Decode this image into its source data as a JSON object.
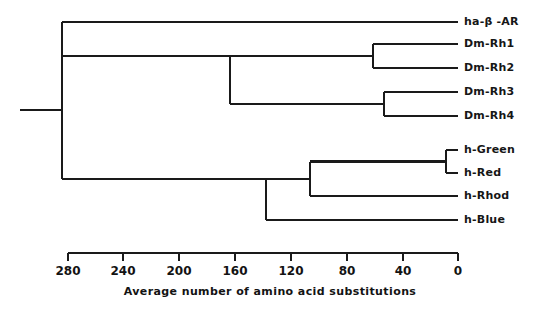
{
  "figure": {
    "type": "phylogenetic-tree-dendrogram",
    "background_color": "#ffffff",
    "line_color": "#1a1a1a",
    "text_color": "#131313"
  },
  "chart_data": {
    "type": "line",
    "subtype": "dendrogram",
    "title": "",
    "xlabel": "Average number of amino acid substitutions",
    "ylabel": "",
    "xlim": [
      280,
      0
    ],
    "x_axis_reversed": true,
    "grid": false,
    "legend": false,
    "tick_values": [
      280,
      240,
      200,
      160,
      120,
      80,
      40,
      0
    ],
    "tick_labels": [
      "280",
      "240",
      "200",
      "160",
      "120",
      "80",
      "40",
      "0"
    ],
    "tick_interval": 40,
    "leaves": [
      {
        "id": "ha-b-AR",
        "label": "ha-β -AR",
        "label_plain": "ha-beta-AR",
        "y": 22,
        "branch_from": 280
      },
      {
        "id": "Dm-Rh1",
        "label": "Dm-Rh1",
        "label_plain": "Dm-Rh1",
        "y": 44,
        "branch_from": 62
      },
      {
        "id": "Dm-Rh2",
        "label": "Dm-Rh2",
        "label_plain": "Dm-Rh2",
        "y": 68,
        "branch_from": 62
      },
      {
        "id": "Dm-Rh3",
        "label": "Dm-Rh3",
        "label_plain": "Dm-Rh3",
        "y": 92,
        "branch_from": 54
      },
      {
        "id": "Dm-Rh4",
        "label": "Dm-Rh4",
        "label_plain": "Dm-Rh4",
        "y": 116,
        "branch_from": 54
      },
      {
        "id": "h-Green",
        "label": "h-Green",
        "label_plain": "h-Green",
        "y": 150,
        "branch_from": 9
      },
      {
        "id": "h-Red",
        "label": "h-Red",
        "label_plain": "h-Red",
        "y": 173,
        "branch_from": 9
      },
      {
        "id": "h-Rhod",
        "label": "h-Rhod",
        "label_plain": "h-Rhod",
        "y": 196,
        "branch_from": 109
      },
      {
        "id": "h-Blue",
        "label": "h-Blue",
        "label_plain": "h-Blue",
        "y": 220,
        "branch_from": 141
      }
    ],
    "nodes": [
      {
        "id": "root",
        "value": 292,
        "children": [
          "ha-b-AR",
          "node-opsins"
        ]
      },
      {
        "id": "node-opsins",
        "value": 292,
        "children": [
          "node-dm",
          "node-vert"
        ]
      },
      {
        "id": "node-dm",
        "value": 168,
        "children": [
          "node-rh12",
          "node-rh34"
        ]
      },
      {
        "id": "node-rh12",
        "value": 62,
        "children": [
          "Dm-Rh1",
          "Dm-Rh2"
        ]
      },
      {
        "id": "node-rh34",
        "value": 54,
        "children": [
          "Dm-Rh3",
          "Dm-Rh4"
        ]
      },
      {
        "id": "node-vert",
        "value": 141,
        "children": [
          "node-grr",
          "h-Blue"
        ]
      },
      {
        "id": "node-grr",
        "value": 109,
        "children": [
          "node-gr",
          "h-Rhod"
        ]
      },
      {
        "id": "node-gr",
        "value": 9,
        "children": [
          "h-Green",
          "h-Red"
        ]
      }
    ],
    "root_stem_start_value": 322,
    "axis_y_px": 253,
    "axis_x0_px": 68,
    "axis_x1_px": 458,
    "px_per_unit": 1.3929
  },
  "axis": {
    "title": "Average number of amino acid substitutions",
    "ticks": [
      {
        "label": "280",
        "x": 68
      },
      {
        "label": "240",
        "x": 123
      },
      {
        "label": "200",
        "x": 179
      },
      {
        "label": "160",
        "x": 235
      },
      {
        "label": "120",
        "x": 291
      },
      {
        "label": "80",
        "x": 347
      },
      {
        "label": "40",
        "x": 403
      },
      {
        "label": "0",
        "x": 458
      }
    ]
  },
  "tree_geometry": {
    "leaf_tip_x": 458,
    "label_x": 464,
    "root_stem_x_start": 20,
    "root_node_x": 62,
    "opsin_node_x": 62,
    "dm_node_x": 230,
    "rh12_node_x": 373,
    "rh34_node_x": 384,
    "vert_node_x": 266,
    "grr_node_x": 310,
    "gr_node_x": 446,
    "root_y": 110,
    "stroke_width": 2.1
  }
}
